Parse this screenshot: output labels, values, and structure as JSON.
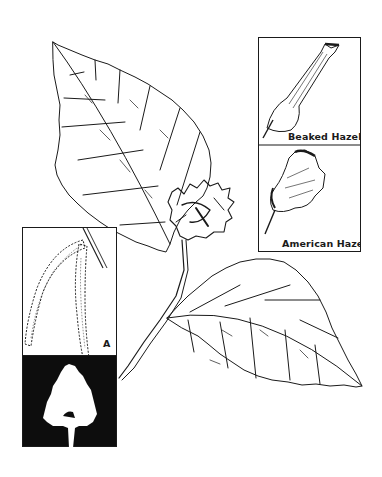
{
  "figure": {
    "insets": {
      "beaked_hazel": {
        "label": "Beaked Hazel"
      },
      "american_hazel": {
        "label": "American Hazel"
      },
      "catkins": {
        "label": "A"
      },
      "silhouette": {
        "label": ""
      }
    },
    "colors": {
      "ink": "#1a1a1a",
      "background": "#ffffff",
      "silhouette_bg": "#0d0d0d"
    }
  }
}
